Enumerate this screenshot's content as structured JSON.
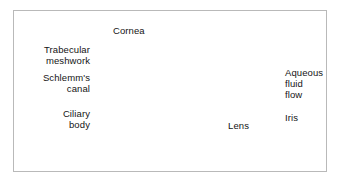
{
  "figure": {
    "type": "anatomical-illustration",
    "style": "grayscale halftone medical illustration",
    "frame_color": "#b9b9b9",
    "background_color": "#ffffff",
    "text_color": "#141414",
    "labels": [
      {
        "id": "cornea",
        "text": "Cornea",
        "lines": [
          "Cornea"
        ],
        "align": "left"
      },
      {
        "id": "trabecular",
        "text": "Trabecular meshwork",
        "lines": [
          "Trabecular",
          "meshwork"
        ],
        "align": "right"
      },
      {
        "id": "schlemms",
        "text": "Schlemm's canal",
        "lines": [
          "Schlemm's",
          "canal"
        ],
        "align": "right"
      },
      {
        "id": "ciliary",
        "text": "Ciliary body",
        "lines": [
          "Ciliary",
          "body"
        ],
        "align": "right"
      },
      {
        "id": "aqueous",
        "text": "Aqueous fluid flow",
        "lines": [
          "Aqueous",
          "fluid",
          "flow"
        ],
        "align": "left"
      },
      {
        "id": "iris",
        "text": "Iris",
        "lines": [
          "Iris"
        ],
        "align": "left"
      },
      {
        "id": "lens",
        "text": "Lens",
        "lines": [
          "Lens"
        ],
        "align": "left"
      }
    ],
    "label_text": {
      "cornea": "Cornea",
      "trabecular_line1": "Trabecular",
      "trabecular_line2": "meshwork",
      "schlemms_line1": "Schlemm's",
      "schlemms_line2": "canal",
      "ciliary_line1": "Ciliary",
      "ciliary_line2": "body",
      "aqueous_line1": "Aqueous",
      "aqueous_line2": "fluid",
      "aqueous_line3": "flow",
      "iris": "Iris",
      "lens": "Lens"
    },
    "flow_arrows": {
      "count": 4,
      "description": "Dark arrows indicating aqueous humor flowing from the posterior chamber forward over the lens and out through the trabecular meshwork into Schlemm's canal"
    }
  }
}
